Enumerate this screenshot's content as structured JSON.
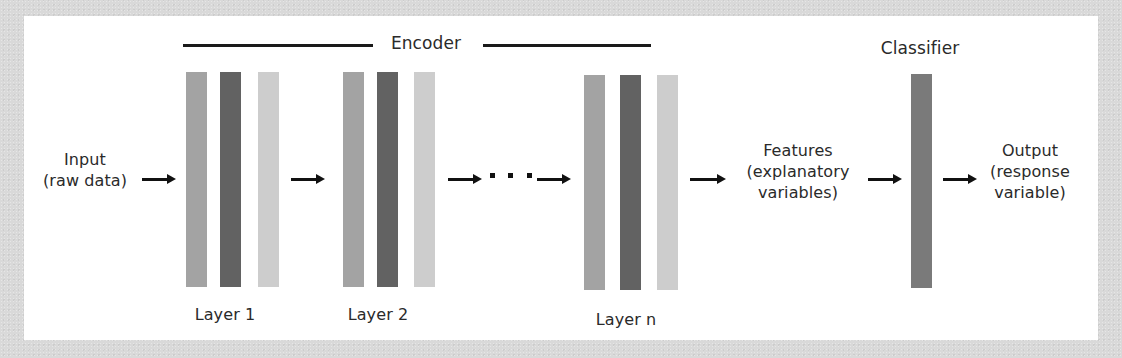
{
  "diagram": {
    "title_encoder": "Encoder",
    "title_classifier": "Classifier",
    "input": {
      "line1": "Input",
      "line2": "(raw data)"
    },
    "features": {
      "line1": "Features",
      "line2": "(explanatory",
      "line3": "variables)"
    },
    "output": {
      "line1": "Output",
      "line2": "(response",
      "line3": "variable)"
    },
    "layers": [
      {
        "label": "Layer 1"
      },
      {
        "label": "Layer 2"
      },
      {
        "label": "Layer n"
      }
    ],
    "ellipsis": "...",
    "colors": {
      "background": "#d9d9d9",
      "panel": "#ffffff",
      "bar_mid": "#a3a3a3",
      "bar_dark": "#626262",
      "bar_light": "#cdcdcd",
      "classifier_bar": "#7a7a7a",
      "line": "#1a1a1a",
      "text": "#2a2a2a"
    },
    "flow": [
      "Input (raw data)",
      "Layer 1",
      "Layer 2",
      "...",
      "Layer n",
      "Features (explanatory variables)",
      "Classifier",
      "Output (response variable)"
    ]
  }
}
